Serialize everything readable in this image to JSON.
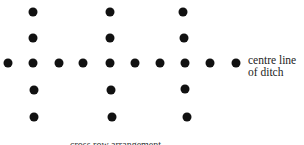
{
  "diagram": {
    "label_line1": "centre line",
    "label_line2": "of ditch",
    "caption": "cross row arrangement",
    "dot_color": "#111111",
    "dots": [
      {
        "x": 33,
        "y": 12
      },
      {
        "x": 110,
        "y": 12
      },
      {
        "x": 183,
        "y": 12
      },
      {
        "x": 33,
        "y": 38
      },
      {
        "x": 110,
        "y": 38
      },
      {
        "x": 184,
        "y": 38
      },
      {
        "x": 8,
        "y": 63
      },
      {
        "x": 33,
        "y": 63
      },
      {
        "x": 59,
        "y": 63
      },
      {
        "x": 83,
        "y": 63
      },
      {
        "x": 110,
        "y": 63
      },
      {
        "x": 135,
        "y": 63
      },
      {
        "x": 160,
        "y": 63
      },
      {
        "x": 185,
        "y": 63
      },
      {
        "x": 210,
        "y": 63
      },
      {
        "x": 236,
        "y": 63
      },
      {
        "x": 34,
        "y": 90
      },
      {
        "x": 111,
        "y": 90
      },
      {
        "x": 185,
        "y": 89
      },
      {
        "x": 34,
        "y": 117
      },
      {
        "x": 112,
        "y": 117
      },
      {
        "x": 187,
        "y": 117
      }
    ]
  }
}
